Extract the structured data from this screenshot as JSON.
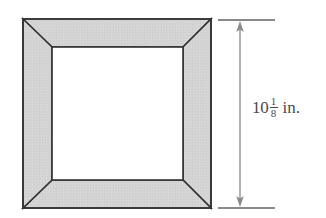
{
  "figure": {
    "name": "square-picture-frame-with-height-dimension",
    "background_color": "#ffffff"
  },
  "frame": {
    "fill_color": "#d6d6d6",
    "stroke_color": "#333333",
    "opening_fill_color": "#ffffff",
    "outer": {
      "left": 23,
      "top": 19,
      "right": 211,
      "bottom": 208
    },
    "inner": {
      "left": 52,
      "top": 47,
      "right": 183,
      "bottom": 180
    },
    "border_width_px": 28,
    "corner_style": "mitered",
    "miters": [
      "top-left-miter",
      "top-right-miter",
      "bottom-right-miter",
      "bottom-left-miter"
    ]
  },
  "dimension": {
    "orientation": "vertical",
    "line_x": 240,
    "line_top": 22,
    "line_bottom": 206,
    "arrowheads": "both",
    "stroke_color": "#8a8a8a",
    "extension_lines": [
      {
        "name": "top-extension-line",
        "x1": 218,
        "x2": 275,
        "y": 20
      },
      {
        "name": "bottom-extension-line",
        "x1": 218,
        "x2": 275,
        "y": 208
      }
    ],
    "label": {
      "text": "10 1/8 in.",
      "whole": "10",
      "numerator": "1",
      "denominator": "8",
      "unit": "in.",
      "color": "#4a4a4a"
    }
  }
}
